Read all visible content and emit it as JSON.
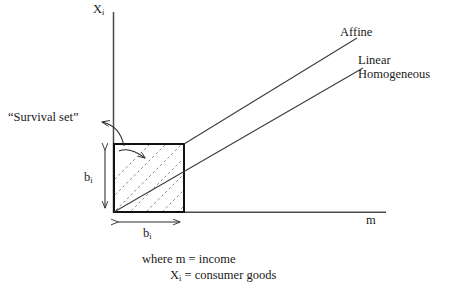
{
  "figure": {
    "title_hidden": "",
    "axes": {
      "y_label_main": "X",
      "y_label_sub": "i",
      "x_label": "m"
    },
    "curves": [
      {
        "id": "affine",
        "label": "Affine"
      },
      {
        "id": "linear_homogeneous",
        "label_line1": "Linear",
        "label_line2": "Homogeneous"
      }
    ],
    "annotations": {
      "survival_set": "“Survival set”",
      "box_height_label_main": "b",
      "box_height_label_sub": "i",
      "box_width_label_main": "b",
      "box_width_label_sub": "i"
    },
    "caption": {
      "line1": "where m = income",
      "line2_main": "X",
      "line2_sub": "i",
      "line2_rest": " = consumer goods"
    },
    "colors": {
      "ink": "#1a1a1a",
      "axis": "#4a4a4a",
      "box_stroke": "#111111",
      "hatch": "#7a7a7a",
      "ray": "#3a3a3a",
      "background": "#ffffff"
    },
    "geometry": {
      "origin_x": 114,
      "origin_y": 212,
      "box_right": 184,
      "box_top": 144,
      "x_axis_end": 386,
      "y_axis_top": 12,
      "affine_end_x": 357,
      "affine_end_y": 38,
      "linhom_end_x": 363,
      "linhom_end_y": 68
    }
  }
}
